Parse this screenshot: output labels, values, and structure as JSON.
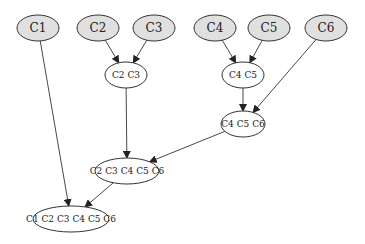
{
  "diagram": {
    "type": "directed-tree",
    "nodes": [
      {
        "id": "n1",
        "label": "C1",
        "cx": 38,
        "cy": 28,
        "rx": 21,
        "ry": 13,
        "fill": "#e0e0e0",
        "fontSize": 12
      },
      {
        "id": "n2",
        "label": "C2",
        "cx": 98,
        "cy": 28,
        "rx": 21,
        "ry": 13,
        "fill": "#e0e0e0",
        "fontSize": 12
      },
      {
        "id": "n3",
        "label": "C3",
        "cx": 154,
        "cy": 28,
        "rx": 21,
        "ry": 13,
        "fill": "#e0e0e0",
        "fontSize": 12
      },
      {
        "id": "n4",
        "label": "C4",
        "cx": 215,
        "cy": 28,
        "rx": 21,
        "ry": 13,
        "fill": "#e0e0e0",
        "fontSize": 12
      },
      {
        "id": "n5",
        "label": "C5",
        "cx": 269,
        "cy": 28,
        "rx": 21,
        "ry": 13,
        "fill": "#e0e0e0",
        "fontSize": 12
      },
      {
        "id": "n6",
        "label": "C6",
        "cx": 326,
        "cy": 28,
        "rx": 21,
        "ry": 13,
        "fill": "#e0e0e0",
        "fontSize": 12
      },
      {
        "id": "n23",
        "label": "C2 C3",
        "cx": 126,
        "cy": 75,
        "rx": 21,
        "ry": 13,
        "fill": "#ffffff",
        "fontSize": 9
      },
      {
        "id": "n45",
        "label": "C4 C5",
        "cx": 243,
        "cy": 75,
        "rx": 21,
        "ry": 13,
        "fill": "#ffffff",
        "fontSize": 9
      },
      {
        "id": "n456",
        "label": "C4 C5 C6",
        "cx": 243,
        "cy": 124,
        "rx": 22,
        "ry": 13,
        "fill": "#ffffff",
        "fontSize": 9
      },
      {
        "id": "n23456",
        "label": "C2 C3 C4 C5 C6",
        "cx": 127,
        "cy": 171,
        "rx": 32,
        "ry": 13,
        "fill": "#ffffff",
        "fontSize": 9
      },
      {
        "id": "n123456",
        "label": "C1 C2 C3 C4 C5 C6",
        "cx": 71,
        "cy": 219,
        "rx": 38,
        "ry": 13,
        "fill": "#ffffff",
        "fontSize": 9
      }
    ],
    "edges": [
      {
        "from": "n2",
        "to": "n23"
      },
      {
        "from": "n3",
        "to": "n23"
      },
      {
        "from": "n4",
        "to": "n45"
      },
      {
        "from": "n5",
        "to": "n45"
      },
      {
        "from": "n45",
        "to": "n456"
      },
      {
        "from": "n6",
        "to": "n456"
      },
      {
        "from": "n23",
        "to": "n23456"
      },
      {
        "from": "n456",
        "to": "n23456"
      },
      {
        "from": "n1",
        "to": "n123456"
      },
      {
        "from": "n23456",
        "to": "n123456"
      }
    ],
    "colors": {
      "leaf_fill": "#e0e0e0",
      "merged_fill": "#ffffff",
      "stroke": "#333333",
      "text": "#222222"
    }
  }
}
